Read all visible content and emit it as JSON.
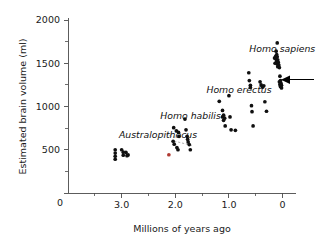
{
  "figure": {
    "background_color": "#ffffff",
    "point_color": "#101010",
    "highlight_point_color": "#b03a32",
    "axis_color": "#4a4a4a"
  },
  "chart_data": {
    "type": "scatter",
    "title": "",
    "xlabel": "Millions of years ago",
    "ylabel": "Estimated brain volume (ml)",
    "x_axis_reversed": true,
    "xlim": [
      4.0,
      -0.25
    ],
    "ylim": [
      0,
      2000
    ],
    "grid": false,
    "legend_position": "none",
    "x_tick_labels": [
      "3.0",
      "2.0",
      "1.0",
      "0"
    ],
    "x_tick_values": [
      3.0,
      2.0,
      1.0,
      0.0
    ],
    "x_minor_tick_values": [
      3.5,
      2.5,
      1.5,
      0.5
    ],
    "y_tick_labels": [
      "0",
      "500",
      "1000",
      "1500",
      "2000"
    ],
    "y_tick_values": [
      0,
      500,
      1000,
      1500,
      2000
    ],
    "y_minor_tick_values": [
      250,
      750,
      1250,
      1750
    ],
    "origin_label": "0",
    "annotations": [
      {
        "text": "Australopithecus",
        "x": 3.05,
        "y": 640,
        "name": "label-australopithecus"
      },
      {
        "text": "Homo habilis",
        "x": 2.28,
        "y": 860,
        "name": "label-homo-habilis"
      },
      {
        "text": "Homo erectus",
        "x": 1.42,
        "y": 1160,
        "name": "label-homo-erectus"
      },
      {
        "text": "Homo sapiens",
        "x": 0.62,
        "y": 1630,
        "name": "label-homo-sapiens"
      }
    ],
    "pointer": {
      "label": "marker-arrow",
      "y": 1310,
      "x_tip": 0.03,
      "direction": "left"
    },
    "trend_lines": [
      {
        "name": "habilis-trend-upper",
        "x1": 2.25,
        "y1": 690,
        "x2": 1.98,
        "y2": 640
      },
      {
        "name": "habilis-trend-lower",
        "x1": 2.02,
        "y1": 600,
        "x2": 1.66,
        "y2": 545
      }
    ],
    "series": [
      {
        "name": "Australopithecus",
        "color": "#101010",
        "points": [
          [
            3.12,
            500
          ],
          [
            3.12,
            462
          ],
          [
            3.12,
            425
          ],
          [
            3.12,
            390
          ],
          [
            3.0,
            500
          ],
          [
            2.97,
            472
          ],
          [
            2.92,
            470
          ],
          [
            2.88,
            440
          ],
          [
            2.97,
            437
          ],
          [
            2.9,
            432
          ]
        ]
      },
      {
        "name": "Australopithecus-highlighted",
        "color": "#b03a32",
        "points": [
          [
            2.12,
            442
          ]
        ]
      },
      {
        "name": "Homo habilis",
        "color": "#101010",
        "points": [
          [
            2.03,
            755
          ],
          [
            1.98,
            718
          ],
          [
            1.94,
            700
          ],
          [
            1.93,
            655
          ],
          [
            2.04,
            598
          ],
          [
            2.02,
            565
          ],
          [
            1.97,
            525
          ],
          [
            1.95,
            500
          ],
          [
            1.82,
            855
          ],
          [
            1.8,
            730
          ],
          [
            1.78,
            655
          ],
          [
            1.77,
            620
          ],
          [
            1.76,
            590
          ],
          [
            1.74,
            560
          ],
          [
            1.72,
            500
          ]
        ]
      },
      {
        "name": "Homo erectus",
        "color": "#101010",
        "points": [
          [
            1.18,
            1060
          ],
          [
            1.12,
            955
          ],
          [
            1.1,
            900
          ],
          [
            1.12,
            880
          ],
          [
            1.08,
            865
          ],
          [
            1.1,
            840
          ],
          [
            1.07,
            775
          ],
          [
            1.0,
            1125
          ],
          [
            0.98,
            880
          ],
          [
            0.96,
            730
          ],
          [
            0.88,
            725
          ],
          [
            0.63,
            1390
          ],
          [
            0.62,
            1300
          ],
          [
            0.6,
            1245
          ],
          [
            0.6,
            1220
          ],
          [
            0.58,
            1010
          ],
          [
            0.57,
            940
          ],
          [
            0.55,
            775
          ],
          [
            0.42,
            1285
          ],
          [
            0.4,
            1250
          ],
          [
            0.38,
            1230
          ],
          [
            0.37,
            1225
          ],
          [
            0.35,
            1240
          ],
          [
            0.33,
            1055
          ],
          [
            0.3,
            945
          ]
        ]
      },
      {
        "name": "Homo sapiens",
        "color": "#101010",
        "points": [
          [
            0.1,
            1735
          ],
          [
            0.12,
            1640
          ],
          [
            0.11,
            1600
          ],
          [
            0.13,
            1580
          ],
          [
            0.1,
            1575
          ],
          [
            0.12,
            1545
          ],
          [
            0.09,
            1540
          ],
          [
            0.11,
            1520
          ],
          [
            0.08,
            1510
          ],
          [
            0.1,
            1490
          ],
          [
            0.07,
            1480
          ],
          [
            0.09,
            1460
          ],
          [
            0.06,
            1450
          ],
          [
            0.15,
            1560
          ],
          [
            0.14,
            1500
          ],
          [
            0.05,
            1350
          ],
          [
            0.04,
            1300
          ],
          [
            0.06,
            1285
          ],
          [
            0.03,
            1270
          ],
          [
            0.05,
            1255
          ],
          [
            0.02,
            1245
          ],
          [
            0.04,
            1230
          ],
          [
            0.02,
            1215
          ]
        ]
      }
    ]
  }
}
